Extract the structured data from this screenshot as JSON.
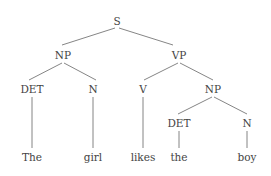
{
  "diagram": {
    "type": "syntax-tree",
    "sentence": "The girl likes the boy",
    "nodes": {
      "s": {
        "label": "S",
        "x": 117,
        "y": 25
      },
      "np1": {
        "label": "NP",
        "x": 63,
        "y": 59
      },
      "vp": {
        "label": "VP",
        "x": 179,
        "y": 59
      },
      "det1": {
        "label": "DET",
        "x": 32,
        "y": 93
      },
      "n1": {
        "label": "N",
        "x": 93,
        "y": 93
      },
      "v": {
        "label": "V",
        "x": 143,
        "y": 93
      },
      "np2": {
        "label": "NP",
        "x": 213,
        "y": 93
      },
      "det2": {
        "label": "DET",
        "x": 179,
        "y": 127
      },
      "n2": {
        "label": "N",
        "x": 247,
        "y": 127
      }
    },
    "words": {
      "w1": {
        "label": "The",
        "x": 32,
        "y": 161
      },
      "w2": {
        "label": "girl",
        "x": 93,
        "y": 161
      },
      "w3": {
        "label": "likes",
        "x": 143,
        "y": 161
      },
      "w4": {
        "label": "the",
        "x": 179,
        "y": 161
      },
      "w5": {
        "label": "boy",
        "x": 247,
        "y": 161
      }
    },
    "edges": [
      [
        "S",
        "NP"
      ],
      [
        "S",
        "VP"
      ],
      [
        "NP",
        "DET"
      ],
      [
        "NP",
        "N"
      ],
      [
        "VP",
        "V"
      ],
      [
        "VP",
        "NP"
      ],
      [
        "NP",
        "DET"
      ],
      [
        "NP",
        "N"
      ],
      [
        "DET",
        "The"
      ],
      [
        "N",
        "girl"
      ],
      [
        "V",
        "likes"
      ],
      [
        "DET",
        "the"
      ],
      [
        "N",
        "boy"
      ]
    ]
  }
}
